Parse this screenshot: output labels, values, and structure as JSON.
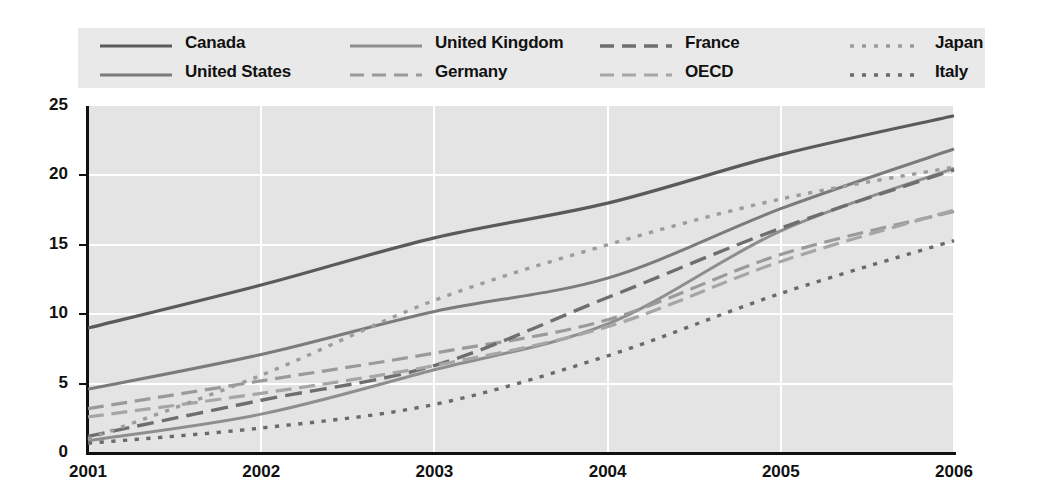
{
  "chart_data": {
    "type": "line",
    "title": "",
    "xlabel": "",
    "ylabel": "",
    "x": [
      2001,
      2002,
      2003,
      2004,
      2005,
      2006
    ],
    "xtick_labels": [
      "2001",
      "2002",
      "2003",
      "2004",
      "2005",
      "2006"
    ],
    "ytick_labels": [
      "0",
      "5",
      "10",
      "15",
      "20",
      "25"
    ],
    "yticks": [
      0,
      5,
      10,
      15,
      20,
      25
    ],
    "ylim": [
      0,
      25
    ],
    "xlim": [
      2001,
      2006
    ],
    "grid": "horizontal-and-vertical-white",
    "legend_position": "top",
    "plot_background": "#e4e4e4",
    "series": [
      {
        "name": "Canada",
        "style": "solid",
        "color": "#5a5a5a",
        "width": 3.2,
        "values": [
          9.0,
          12.1,
          15.5,
          18.0,
          21.5,
          24.3
        ]
      },
      {
        "name": "United States",
        "style": "solid",
        "color": "#7b7b7b",
        "width": 3.0,
        "values": [
          4.6,
          7.1,
          10.2,
          12.6,
          17.6,
          21.9
        ]
      },
      {
        "name": "United Kingdom",
        "style": "solid",
        "color": "#8e8e8e",
        "width": 3.0,
        "values": [
          0.9,
          2.8,
          6.0,
          9.3,
          16.0,
          20.5
        ]
      },
      {
        "name": "Germany",
        "style": "dashed",
        "color": "#9a9a9a",
        "width": 3.2,
        "values": [
          3.2,
          5.2,
          7.2,
          9.6,
          14.3,
          17.4
        ]
      },
      {
        "name": "France",
        "style": "dashed",
        "color": "#6e6e6e",
        "width": 3.4,
        "values": [
          1.2,
          3.8,
          6.3,
          11.2,
          16.2,
          20.4
        ]
      },
      {
        "name": "OECD",
        "style": "dashed",
        "color": "#a6a6a6",
        "width": 3.2,
        "values": [
          2.6,
          4.3,
          6.3,
          9.1,
          13.8,
          17.5
        ]
      },
      {
        "name": "Japan",
        "style": "dotted",
        "color": "#9c9c9c",
        "width": 3.4,
        "values": [
          1.0,
          5.6,
          11.0,
          15.0,
          18.3,
          20.6
        ]
      },
      {
        "name": "Italy",
        "style": "dotted",
        "color": "#6a6a6a",
        "width": 3.4,
        "values": [
          0.7,
          1.8,
          3.5,
          7.0,
          11.5,
          15.3
        ]
      }
    ]
  },
  "legend": {
    "columns": [
      {
        "items": [
          {
            "label": "Canada",
            "series": 0
          },
          {
            "label": "United States",
            "series": 1
          }
        ]
      },
      {
        "items": [
          {
            "label": "United Kingdom",
            "series": 2
          },
          {
            "label": "Germany",
            "series": 3
          }
        ]
      },
      {
        "items": [
          {
            "label": "France",
            "series": 4
          },
          {
            "label": "OECD",
            "series": 5
          }
        ]
      },
      {
        "items": [
          {
            "label": "Japan",
            "series": 6
          },
          {
            "label": "Italy",
            "series": 7
          }
        ]
      }
    ]
  }
}
